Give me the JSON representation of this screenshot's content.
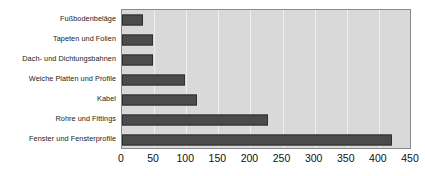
{
  "chart_data": {
    "type": "bar",
    "orientation": "horizontal",
    "title": "",
    "subtitle": "",
    "xlabel": "",
    "ylabel": "",
    "xlim": [
      0,
      450
    ],
    "xticks": [
      0,
      50,
      100,
      150,
      200,
      250,
      300,
      350,
      400,
      450
    ],
    "tick_labels": [
      "0",
      "50",
      "100",
      "150",
      "200",
      "250",
      "300",
      "350",
      "400",
      "450"
    ],
    "grid": true,
    "grid_axis": "x",
    "legend": false,
    "legend_position": "none",
    "categories": [
      "Fußbodenbeläge",
      "Tapeten und Folien",
      "Dach- und Dichtungsbahnen",
      "Weiche Platten und Profile",
      "Kabel",
      "Rohre und Fittings",
      "Fenster und Fensterprofile"
    ],
    "values": [
      32,
      49,
      48,
      98,
      117,
      227,
      420
    ],
    "bar_color": "#4b4b4b",
    "bar_edge_color": "#2e2e2e",
    "plot_background": "#d9d9d9",
    "gridline_color": "#efefef",
    "axis_color": "#8a8a8a"
  }
}
